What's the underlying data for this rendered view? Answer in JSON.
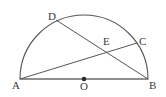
{
  "figure": {
    "type": "geometry-diagram",
    "background_color": "#ffffff",
    "stroke_color": "#555555",
    "label_color": "#3a3a3a",
    "diameter_color": "#6b6b6b",
    "points": [
      {
        "name": "A",
        "label": "A",
        "x": 20,
        "y": 79,
        "role": "diameter-endpoint"
      },
      {
        "name": "B",
        "label": "B",
        "x": 148,
        "y": 79,
        "role": "diameter-endpoint"
      },
      {
        "name": "O",
        "label": "O",
        "x": 84,
        "y": 79,
        "role": "center",
        "marker": "filled-dot"
      },
      {
        "name": "C",
        "label": "C",
        "x": 137,
        "y": 43,
        "role": "arc-point"
      },
      {
        "name": "D",
        "label": "D",
        "x": 56,
        "y": 20,
        "role": "arc-point"
      },
      {
        "name": "E",
        "label": "E",
        "x": 108,
        "y": 48,
        "role": "intersection"
      }
    ],
    "segments": [
      {
        "name": "diameter-AB",
        "from": "A",
        "to": "B"
      },
      {
        "name": "chord-AC",
        "from": "A",
        "to": "C"
      },
      {
        "name": "chord-DB",
        "from": "D",
        "to": "B"
      }
    ],
    "arc": {
      "name": "semicircle-arc",
      "center_x": 84,
      "center_y": 79,
      "radius": 64,
      "from": "A",
      "to": "B"
    },
    "labels": {
      "A": "A",
      "B": "B",
      "O": "O",
      "C": "C",
      "D": "D",
      "E": "E"
    }
  }
}
